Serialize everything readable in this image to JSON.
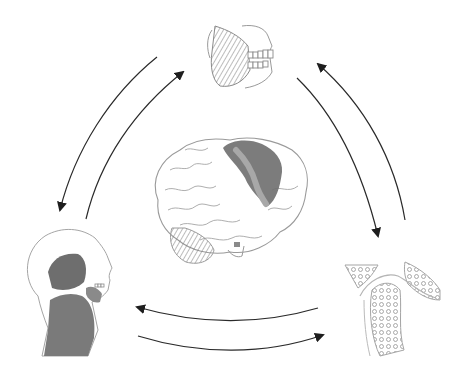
{
  "diagram": {
    "type": "cycle",
    "center": {
      "id": "brain",
      "label": "",
      "highlight_region": "sensorimotor cortex (shaded)"
    },
    "nodes": [
      {
        "id": "jaw",
        "position": "top",
        "depicts": "jaw with masseter muscle and teeth"
      },
      {
        "id": "head-neck",
        "position": "bottom-left",
        "depicts": "head and neck musculature in profile"
      },
      {
        "id": "joint",
        "position": "bottom-right",
        "depicts": "temporomandibular joint bone cross-section"
      }
    ],
    "edges": [
      {
        "from": "jaw",
        "to": "head-neck"
      },
      {
        "from": "head-neck",
        "to": "jaw"
      },
      {
        "from": "head-neck",
        "to": "joint"
      },
      {
        "from": "joint",
        "to": "head-neck"
      },
      {
        "from": "joint",
        "to": "jaw"
      },
      {
        "from": "jaw",
        "to": "joint"
      }
    ],
    "colors": {
      "line": "#2a2a2a",
      "sketch": "#9a9a9a",
      "shade_dark": "#6e6e6e",
      "shade_light": "#a8a8a8",
      "background": "#ffffff"
    }
  }
}
